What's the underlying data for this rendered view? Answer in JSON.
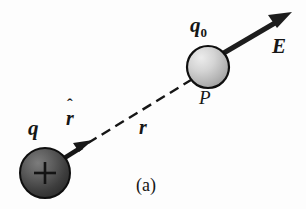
{
  "figure": {
    "caption": "(a)",
    "background_color": "#fdfdfd",
    "ink_color": "#161616",
    "labels": {
      "source_charge": "q",
      "unit_vector_base": "r",
      "unit_vector_hat": "ˆ",
      "distance": "r",
      "test_charge": "q",
      "test_charge_subscript": "0",
      "point": "P",
      "field_vector": "E"
    },
    "elements": {
      "source_sphere": {
        "name": "positive-charge-sphere",
        "sign": "+",
        "center_x": 45,
        "center_y": 173,
        "radius": 25,
        "fill_light": "#6e6e6e",
        "fill_dark": "#2f2f2f",
        "outline": "#101010"
      },
      "test_sphere": {
        "name": "test-charge-sphere",
        "center_x": 208,
        "center_y": 67,
        "radius": 21,
        "fill_light": "#e4e4e4",
        "fill_dark": "#a8a8a8",
        "outline": "#101010"
      },
      "unit_vector_arrow": {
        "name": "r-hat-arrow",
        "x1": 62,
        "y1": 159,
        "x2": 91,
        "y2": 141
      },
      "dashed_line": {
        "name": "separation-dashed-line",
        "x1": 88,
        "y1": 143,
        "x2": 191,
        "y2": 80,
        "dash": "10 6"
      },
      "field_arrow": {
        "name": "field-vector-arrow",
        "x1": 223,
        "y1": 53,
        "x2": 291,
        "y2": 13
      }
    }
  }
}
